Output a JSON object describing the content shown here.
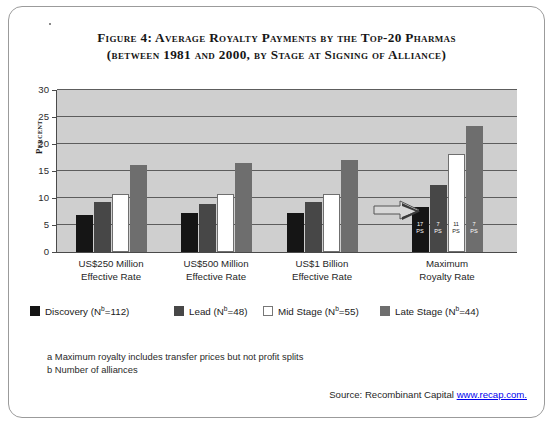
{
  "figure": {
    "title_line1": "Figure 4:  Average Royalty Payments by the Top-20 Pharmas",
    "title_line2": "(between 1981 and 2000, by Stage at Signing of Alliance)",
    "footnote_a": "a Maximum royalty includes transfer prices but not profit splits",
    "footnote_b": "b Number of alliances",
    "source_prefix": "Source: Recombinant Capital ",
    "source_link": "www.recap.com.",
    "arrow_icon": "right-arrow-icon"
  },
  "chart_data": {
    "type": "bar",
    "title": "Figure 4:  Average Royalty Payments by the Top-20 Pharmas (between 1981 and 2000, by Stage at Signing of Alliance)",
    "xlabel": "",
    "ylabel": "Percent",
    "ylim": [
      0,
      30
    ],
    "yticks": [
      0,
      5,
      10,
      15,
      20,
      25,
      30
    ],
    "ytick_labels": [
      "0",
      "5",
      "10",
      "15",
      "20",
      "25",
      "30"
    ],
    "grid": true,
    "legend_position": "bottom",
    "categories": [
      "US$250 Million Effective Rate",
      "US$500 Million Effective Rate",
      "US$1 Billion Effective Rate",
      "Maximum Royalty Rate"
    ],
    "category_lines": [
      [
        "US$250 Million",
        "Effective Rate"
      ],
      [
        "US$500 Million",
        "Effective Rate"
      ],
      [
        "US$1 Billion",
        "Effective Rate"
      ],
      [
        "Maximum",
        "Royalty Rate"
      ]
    ],
    "series": [
      {
        "name": "Discovery",
        "n": 112,
        "color": "#151515",
        "values": [
          6.8,
          7.3,
          7.2,
          8.4
        ]
      },
      {
        "name": "Lead",
        "n": 48,
        "color": "#474747",
        "values": [
          9.2,
          8.9,
          9.2,
          12.5
        ]
      },
      {
        "name": "Mid Stage",
        "n": 55,
        "color": "#ffffff",
        "values": [
          10.7,
          10.7,
          10.7,
          18.2
        ]
      },
      {
        "name": "Late Stage",
        "n": 44,
        "color": "#6e6e6e",
        "values": [
          16.1,
          16.4,
          17.1,
          23.4
        ]
      }
    ],
    "legend_labels": [
      "Discovery (N b =112)",
      "Lead (N b =48)",
      "Mid Stage (N b =55)",
      "Late Stage (N b =44)"
    ],
    "annotations": [
      {
        "group": "Maximum Royalty Rate",
        "series": "Discovery",
        "value": "17",
        "unit": "PS"
      },
      {
        "group": "Maximum Royalty Rate",
        "series": "Lead",
        "value": "7",
        "unit": "PS"
      },
      {
        "group": "Maximum Royalty Rate",
        "series": "Mid Stage",
        "value": "11",
        "unit": "PS"
      },
      {
        "group": "Maximum Royalty Rate",
        "series": "Late Stage",
        "value": "7",
        "unit": "PS"
      }
    ]
  }
}
